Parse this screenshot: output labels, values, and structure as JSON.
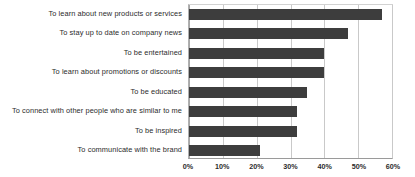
{
  "chart_data": {
    "type": "bar",
    "orientation": "horizontal",
    "title": "",
    "subtitle": "",
    "xlabel": "",
    "ylabel": "",
    "xlim": [
      0,
      60
    ],
    "grid": true,
    "legend": false,
    "legend_position": "none",
    "value_suffix": "%",
    "bar_color": "#3d3d3d",
    "gridline_color": "#c9c9c9",
    "background_color": "#ffffff",
    "categories": [
      "To learn about new products or services",
      "To stay up to date on company news",
      "To be entertained",
      "To learn about promotions or discounts",
      "To be educated",
      "To connect with other people who are similar to me",
      "To be inspired",
      "To communicate with the brand"
    ],
    "values": [
      57,
      47,
      40,
      40,
      35,
      32,
      32,
      21
    ],
    "tick_values": [
      0,
      10,
      20,
      30,
      40,
      50,
      60
    ],
    "tick_labels": [
      "0%",
      "10%",
      "20%",
      "30%",
      "40%",
      "50%",
      "60%"
    ]
  }
}
